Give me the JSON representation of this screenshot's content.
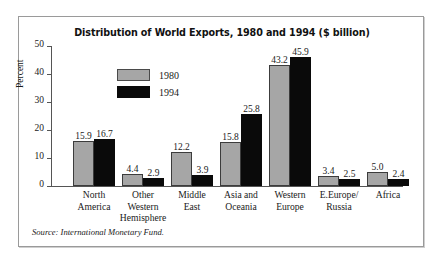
{
  "figure": {
    "title": "Distribution of World Exports, 1980 and 1994 ($ billion)",
    "source": "Source: International Monetary Fund.",
    "frame_border_color": "#9a9a9a",
    "background": "#ffffff"
  },
  "legend": {
    "entries": [
      {
        "label": "1980",
        "color": "#a6a6a6"
      },
      {
        "label": "1994",
        "color": "#0a0a0a"
      }
    ]
  },
  "axis": {
    "ylabel": "Percent",
    "yticks": [
      "0",
      "10",
      "20",
      "30",
      "40",
      "50"
    ]
  },
  "chart_data": {
    "type": "bar",
    "title": "Distribution of World Exports, 1980 and 1994 ($ billion)",
    "xlabel": "",
    "ylabel": "Percent",
    "ylim": [
      0,
      50
    ],
    "ytick_values": [
      0,
      10,
      20,
      30,
      40,
      50
    ],
    "grid": false,
    "legend_position": "upper-left-inside",
    "categories": [
      "North America",
      "Other Western Hemisphere",
      "Middle East",
      "Asia and Oceania",
      "Western Europe",
      "E.Europe/ Russia",
      "Africa"
    ],
    "category_lines": [
      [
        "North",
        "America"
      ],
      [
        "Other",
        "Western",
        "Hemisphere"
      ],
      [
        "Middle",
        "East"
      ],
      [
        "Asia and",
        "Oceania"
      ],
      [
        "Western",
        "Europe"
      ],
      [
        "E.Europe/",
        "Russia"
      ],
      [
        "Africa"
      ]
    ],
    "series": [
      {
        "name": "1980",
        "color": "#a6a6a6",
        "values": [
          15.9,
          4.4,
          12.2,
          15.8,
          43.2,
          3.4,
          5.0
        ],
        "labels": [
          "15.9",
          "4.4",
          "12.2",
          "15.8",
          "43.2",
          "3.4",
          "5.0"
        ]
      },
      {
        "name": "1994",
        "color": "#0a0a0a",
        "values": [
          16.7,
          2.9,
          3.9,
          25.8,
          45.9,
          2.5,
          2.4
        ],
        "labels": [
          "16.7",
          "2.9",
          "3.9",
          "25.8",
          "45.9",
          "2.5",
          "2.4"
        ]
      }
    ]
  }
}
